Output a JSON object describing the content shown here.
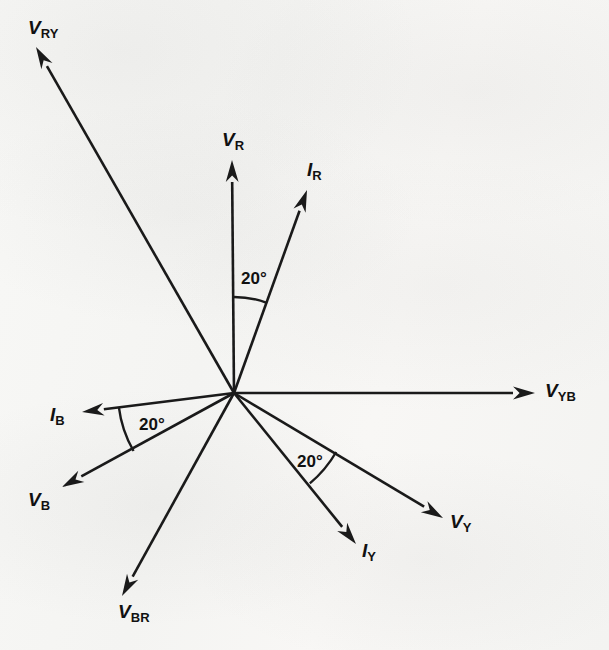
{
  "figure": {
    "origin": {
      "x": 234,
      "y": 393
    },
    "ink_color": "#1a1a1a",
    "paper_color": "#f7f7f5"
  },
  "chart_data": {
    "type": "scatter",
    "subtype": "phasor-diagram",
    "xlabel": "",
    "ylabel": "",
    "grid": false,
    "legend": "none",
    "origin": {
      "x": 234,
      "y": 393
    },
    "angle_reference": "degrees counter-clockwise from positive x-axis (V_YB)",
    "phasors": [
      {
        "name": "V_RY",
        "label_symbol": "V",
        "label_subscript": "RY",
        "kind": "voltage",
        "angle_deg": 118,
        "length_px": 395,
        "tip": {
          "x": 36,
          "y": 47
        },
        "label_pos": {
          "x": 28,
          "y": 18
        }
      },
      {
        "name": "V_R",
        "label_symbol": "V",
        "label_subscript": "R",
        "kind": "voltage",
        "angle_deg": 90,
        "length_px": 233,
        "tip": {
          "x": 232,
          "y": 160
        },
        "label_pos": {
          "x": 222,
          "y": 130
        }
      },
      {
        "name": "I_R",
        "label_symbol": "I",
        "label_subscript": "R",
        "kind": "current",
        "angle_deg": 70,
        "length_px": 216,
        "tip": {
          "x": 307,
          "y": 190
        },
        "label_pos": {
          "x": 307,
          "y": 160
        }
      },
      {
        "name": "V_YB",
        "label_symbol": "V",
        "label_subscript": "YB",
        "kind": "voltage",
        "angle_deg": 0,
        "length_px": 301,
        "tip": {
          "x": 535,
          "y": 393
        },
        "label_pos": {
          "x": 545,
          "y": 381
        }
      },
      {
        "name": "V_Y",
        "label_symbol": "V",
        "label_subscript": "Y",
        "kind": "voltage",
        "angle_deg": -30,
        "length_px": 242,
        "tip": {
          "x": 443,
          "y": 518
        },
        "label_pos": {
          "x": 450,
          "y": 512
        }
      },
      {
        "name": "I_Y",
        "label_symbol": "I",
        "label_subscript": "Y",
        "kind": "current",
        "angle_deg": -50,
        "length_px": 190,
        "tip": {
          "x": 356,
          "y": 544
        },
        "label_pos": {
          "x": 362,
          "y": 541
        }
      },
      {
        "name": "V_BR",
        "label_symbol": "V",
        "label_subscript": "BR",
        "kind": "voltage",
        "angle_deg": -117,
        "length_px": 246,
        "tip": {
          "x": 122,
          "y": 596
        },
        "label_pos": {
          "x": 118,
          "y": 602
        }
      },
      {
        "name": "V_B",
        "label_symbol": "V",
        "label_subscript": "B",
        "kind": "voltage",
        "angle_deg": -150,
        "length_px": 198,
        "tip": {
          "x": 62,
          "y": 487
        },
        "label_pos": {
          "x": 28,
          "y": 490
        }
      },
      {
        "name": "I_B",
        "label_symbol": "I",
        "label_subscript": "B",
        "kind": "current",
        "angle_deg": 187,
        "length_px": 153,
        "tip": {
          "x": 82,
          "y": 412
        },
        "label_pos": {
          "x": 50,
          "y": 405
        }
      }
    ],
    "angle_arcs": [
      {
        "name": "angle-VR-IR",
        "value": "20°",
        "value_deg": 20,
        "between": [
          "V_R",
          "I_R"
        ],
        "from_deg": 70,
        "to_deg": 90,
        "radius_px": 96,
        "label_pos": {
          "x": 241,
          "y": 270
        }
      },
      {
        "name": "angle-IB-VB",
        "value": "20°",
        "value_deg": 20,
        "between": [
          "I_B",
          "V_B"
        ],
        "from_deg": 187,
        "to_deg": 210,
        "radius_px": 116,
        "label_pos": {
          "x": 139,
          "y": 416
        }
      },
      {
        "name": "angle-VY-IY",
        "value": "20°",
        "value_deg": 20,
        "between": [
          "V_Y",
          "I_Y"
        ],
        "from_deg": -50,
        "to_deg": -30,
        "radius_px": 118,
        "label_pos": {
          "x": 297,
          "y": 453
        }
      }
    ]
  }
}
